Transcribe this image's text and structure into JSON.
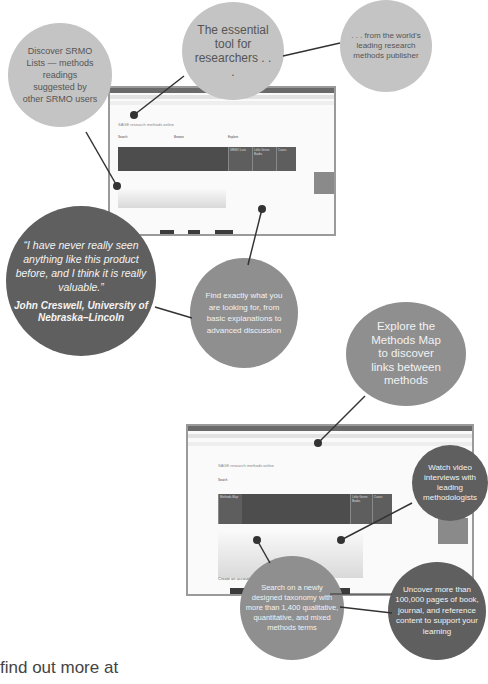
{
  "bubbles": {
    "discover_lists": "Discover SRMO Lists — methods readings suggested by other SRMO users",
    "essential_tool": "The essential tool for researchers . . .",
    "leading_publisher": ". . . from the world's leading research methods publisher",
    "testimonial_quote": "“I have never really seen anything like this product before, and I think it is really valuable.”",
    "testimonial_author": "John Creswell, University of Nebraska–Lincoln",
    "find_exactly": "Find exactly what you are looking for, from basic explanations to advanced discussion",
    "methods_map": "Explore the Methods Map to discover links between methods",
    "watch_video": "Watch video interviews with leading methodologists",
    "taxonomy": "Search on a newly designed taxonomy with more than 1,400 qualitative, quantitative, and mixed methods terms",
    "uncover": "Uncover more than 100,000 pages of book, journal, and reference content to support your learning"
  },
  "screenshot_top": {
    "site_title": "SAGE research methods online",
    "search_label": "Search",
    "browse_label": "Browse",
    "explore_label": "Explore",
    "tiles": [
      "Methods Map",
      "SRMO Lists",
      "Little Green Books",
      "Cases"
    ]
  },
  "screenshot_bottom": {
    "site_title": "SAGE research methods online",
    "search_label": "Search",
    "tiles": [
      "Methods Map",
      "SRMO Lists",
      "Little Green Books",
      "Cases"
    ],
    "create_account": "Create an account"
  },
  "footer": {
    "text": "find out more at"
  },
  "colors": {
    "light_bubble": "#c4c4c4",
    "mid_bubble": "#8f8f8f",
    "dark_bubble": "#5f5f5f"
  }
}
